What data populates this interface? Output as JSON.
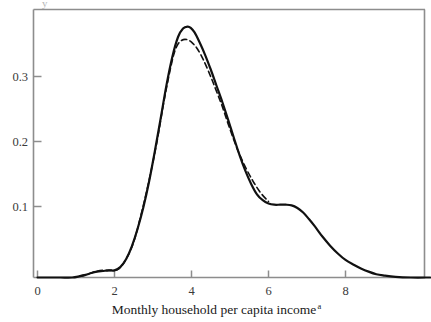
{
  "figure": {
    "background_color": "#ffffff",
    "frame_color": "#8d8d8d",
    "axis_color": "#8d8d8d",
    "curve_color": "#111111",
    "ylabel_partial": "y"
  },
  "caption": {
    "text": "Monthly household per capita income",
    "superscript": "a"
  },
  "chart_data": {
    "type": "line",
    "title": "",
    "xlabel": "Monthly household per capita income",
    "ylabel": "",
    "xlim": [
      -0.1,
      10.2
    ],
    "ylim": [
      0,
      0.414
    ],
    "grid": false,
    "legend": "none",
    "xticks": [
      0,
      2,
      4,
      6,
      8
    ],
    "xtick_labels": [
      "0",
      "2",
      "4",
      "6",
      "8"
    ],
    "yticks": [
      0.1,
      0.2,
      0.3
    ],
    "ytick_labels": [
      "0.1",
      "0.2",
      "0.3"
    ],
    "series": [
      {
        "name": "solid-curve",
        "style": "solid",
        "color": "#111111",
        "x": [
          0.0,
          0.3,
          0.6,
          0.9,
          1.1,
          1.25,
          1.4,
          1.55,
          1.7,
          1.85,
          2.0,
          2.15,
          2.3,
          2.45,
          2.6,
          2.75,
          2.9,
          3.05,
          3.2,
          3.35,
          3.5,
          3.65,
          3.78,
          3.9,
          3.98,
          4.08,
          4.2,
          4.35,
          4.5,
          4.65,
          4.8,
          4.95,
          5.1,
          5.25,
          5.4,
          5.55,
          5.7,
          5.85,
          6.0,
          6.15,
          6.3,
          6.45,
          6.6,
          6.75,
          6.9,
          7.05,
          7.2,
          7.4,
          7.6,
          7.8,
          8.0,
          8.2,
          8.4,
          8.6,
          8.8,
          9.0,
          9.3,
          9.7,
          10.2
        ],
        "y": [
          0.0,
          0.0,
          0.0,
          0.0,
          0.002,
          0.004,
          0.007,
          0.009,
          0.01,
          0.011,
          0.011,
          0.016,
          0.028,
          0.048,
          0.075,
          0.108,
          0.148,
          0.195,
          0.245,
          0.296,
          0.339,
          0.37,
          0.383,
          0.386,
          0.384,
          0.377,
          0.363,
          0.343,
          0.32,
          0.295,
          0.27,
          0.243,
          0.215,
          0.188,
          0.164,
          0.144,
          0.128,
          0.119,
          0.114,
          0.112,
          0.112,
          0.112,
          0.111,
          0.107,
          0.1,
          0.09,
          0.079,
          0.063,
          0.049,
          0.037,
          0.027,
          0.02,
          0.014,
          0.009,
          0.005,
          0.003,
          0.001,
          0.0,
          0.0
        ]
      },
      {
        "name": "dashed-curve",
        "style": "dashed",
        "color": "#111111",
        "x": [
          1.1,
          1.3,
          1.5,
          1.7,
          1.9,
          2.1,
          2.3,
          2.5,
          2.7,
          2.9,
          3.1,
          3.3,
          3.5,
          3.62,
          3.75,
          3.88,
          4.0,
          4.15,
          4.3,
          4.45,
          4.6,
          4.8,
          5.0,
          5.2,
          5.4,
          5.6,
          5.8,
          6.0
        ],
        "y": [
          0.002,
          0.005,
          0.009,
          0.011,
          0.011,
          0.013,
          0.028,
          0.055,
          0.099,
          0.15,
          0.208,
          0.276,
          0.334,
          0.356,
          0.365,
          0.366,
          0.362,
          0.352,
          0.336,
          0.316,
          0.294,
          0.263,
          0.228,
          0.196,
          0.17,
          0.148,
          0.13,
          0.117
        ]
      }
    ],
    "annotations": [
      {
        "name": "peak-solid",
        "x": 3.95,
        "y": 0.386
      },
      {
        "name": "peak-dashed",
        "x": 3.88,
        "y": 0.366
      },
      {
        "name": "left-shoulder",
        "x": 1.75,
        "y": 0.011
      },
      {
        "name": "right-shoulder",
        "x": 6.3,
        "y": 0.112
      }
    ]
  }
}
